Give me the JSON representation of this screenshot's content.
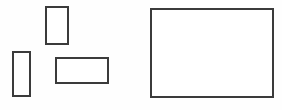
{
  "canvas": {
    "width": 282,
    "height": 110,
    "background_color": "#fefefe",
    "stroke_color": "#3b3b3b",
    "fill_color": "#ffffff",
    "stroke_width": 1.6
  },
  "diagram": {
    "type": "rectangles",
    "shape_count": 4,
    "shapes": [
      {
        "id": "rect-small-portrait",
        "label": "small upright rectangle",
        "x": 46,
        "y": 7,
        "width": 22,
        "height": 37,
        "orientation": "portrait"
      },
      {
        "id": "rect-tall-portrait",
        "label": "tall narrow rectangle",
        "x": 13,
        "y": 52,
        "width": 17,
        "height": 44,
        "orientation": "portrait"
      },
      {
        "id": "rect-wide-landscape",
        "label": "wide short rectangle",
        "x": 56,
        "y": 58,
        "width": 52,
        "height": 25,
        "orientation": "landscape"
      },
      {
        "id": "rect-large-landscape",
        "label": "large rectangle",
        "x": 151,
        "y": 9,
        "width": 122,
        "height": 88,
        "orientation": "landscape"
      }
    ]
  }
}
